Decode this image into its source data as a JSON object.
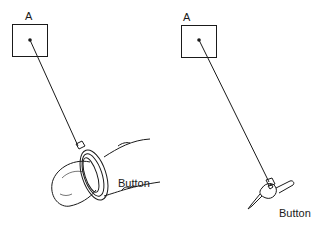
{
  "left_panel": {
    "target_label": "A",
    "device_label": "Button",
    "device": "finger-pressing-ring-button"
  },
  "right_panel": {
    "target_label": "A",
    "device_label": "Button",
    "device": "stylus-pen-with-button"
  },
  "colors": {
    "ink": "#1a1a1a",
    "background": "#ffffff"
  }
}
